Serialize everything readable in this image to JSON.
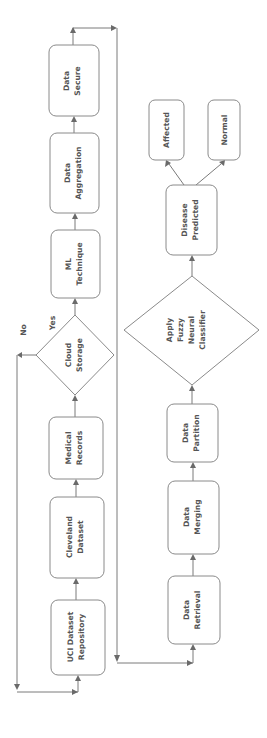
{
  "diagram": {
    "orientation": "rotated -90deg (flow bottom-to-top)",
    "colors": {
      "stroke": "#8a8a8a",
      "text": "#555555",
      "arrow": "#6a6a6a",
      "background": "#ffffff"
    },
    "nodes": {
      "uci": {
        "type": "process",
        "lines": [
          "UCI Dataset",
          "Repository"
        ]
      },
      "cleveland": {
        "type": "process",
        "lines": [
          "Cleveland",
          "Dataset"
        ]
      },
      "medical": {
        "type": "process",
        "lines": [
          "Medical",
          "Records"
        ]
      },
      "cloud": {
        "type": "decision",
        "lines": [
          "Cloud",
          "Storage"
        ]
      },
      "ml": {
        "type": "process",
        "lines": [
          "ML",
          "Technique"
        ]
      },
      "aggregation": {
        "type": "process",
        "lines": [
          "Data",
          "Aggregation"
        ]
      },
      "secure": {
        "type": "process",
        "lines": [
          "Data",
          "Secure"
        ]
      },
      "retrieval": {
        "type": "process",
        "lines": [
          "Data",
          "Retrieval"
        ]
      },
      "merging": {
        "type": "process",
        "lines": [
          "Data",
          "Merging"
        ]
      },
      "partition": {
        "type": "process",
        "lines": [
          "Data",
          "Partition"
        ]
      },
      "classifier": {
        "type": "decision",
        "lines": [
          "Apply",
          "Fuzzy",
          "Neural",
          "Classifier"
        ]
      },
      "predicted": {
        "type": "process",
        "lines": [
          "Disease",
          "Predicted"
        ]
      },
      "affected": {
        "type": "process",
        "lines": [
          "Affected"
        ]
      },
      "normal": {
        "type": "process",
        "lines": [
          "Normal"
        ]
      }
    },
    "edge_labels": {
      "yes": "Yes",
      "no": "No"
    },
    "edges": [
      {
        "from": "UCI Dataset Repository",
        "to": "Cleveland Dataset"
      },
      {
        "from": "Cleveland Dataset",
        "to": "Medical Records"
      },
      {
        "from": "Medical Records",
        "to": "Cloud Storage"
      },
      {
        "from": "Cloud Storage",
        "to": "ML Technique",
        "label": "Yes"
      },
      {
        "from": "Cloud Storage",
        "to": "UCI Dataset Repository",
        "label": "No"
      },
      {
        "from": "ML Technique",
        "to": "Data Aggregation"
      },
      {
        "from": "Data Aggregation",
        "to": "Data Secure"
      },
      {
        "from": "Data Secure",
        "to": "Data Retrieval"
      },
      {
        "from": "Data Retrieval",
        "to": "Data Merging"
      },
      {
        "from": "Data Merging",
        "to": "Data Partition"
      },
      {
        "from": "Data Partition",
        "to": "Apply Fuzzy Neural Classifier"
      },
      {
        "from": "Apply Fuzzy Neural Classifier",
        "to": "Disease Predicted"
      },
      {
        "from": "Disease Predicted",
        "to": "Affected"
      },
      {
        "from": "Disease Predicted",
        "to": "Normal"
      }
    ]
  }
}
